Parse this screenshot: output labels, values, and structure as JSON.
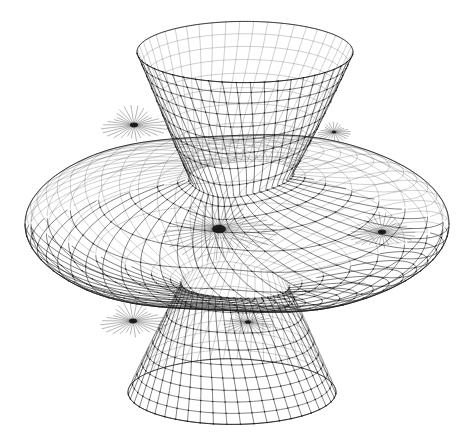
{
  "figure": {
    "title": "Riemann surface wireframe",
    "background_color": "#ffffff",
    "line_color": "#1a1a1a",
    "vertex_color": "#161616",
    "width": 474,
    "height": 446
  },
  "render": {
    "line_width_thin": 0.45,
    "line_width_mid": 0.6,
    "line_width_thick": 0.85,
    "vertex_radius": 0.75,
    "draw_vertices": true
  },
  "camera": {
    "center_x": 237,
    "center_y": 224,
    "scale_x": 210,
    "scale_y": 205,
    "elevation_deg": 22,
    "azimuth_deg": 18,
    "vertical_squash": 0.42
  },
  "chart_data": {
    "type": "surface-wireframe",
    "title": "Riemann surface wireframe",
    "projection": "orthographic",
    "mesh": {
      "u_lines": 48,
      "v_lines": 34,
      "u_range": [
        0,
        6.2831853
      ],
      "v_range": [
        -1.55,
        1.55
      ],
      "quad_count": 1632
    },
    "components": [
      {
        "name": "upper-funnel",
        "description": "trumpet opening flaring upward, rim ellipse at top",
        "rim_center": [
          245,
          52
        ],
        "rim_radius_x": 108,
        "rim_radius_y": 34,
        "throat_center": [
          237,
          170
        ],
        "throat_radius_x": 56,
        "throat_radius_y": 18,
        "top_y": 22
      },
      {
        "name": "outer-brim",
        "description": "wide flared horizontal disk, widest part of the surface",
        "center": [
          237,
          224
        ],
        "radius_x": 212,
        "radius_y": 104,
        "left_x": 25,
        "right_x": 455
      },
      {
        "name": "lower-funnel",
        "description": "trumpet opening flaring downward, rim ellipse at bottom",
        "rim_center": [
          232,
          392
        ],
        "rim_radius_x": 104,
        "rim_radius_y": 36,
        "throat_center": [
          237,
          290
        ],
        "throat_radius_x": 58,
        "throat_radius_y": 18,
        "bottom_y": 428
      }
    ],
    "branch_points": [
      {
        "label": "central-singularity",
        "x": 219,
        "y": 229,
        "size": 7,
        "note": "dominant convergence of mesh curves at center"
      },
      {
        "label": "upper-left-branch",
        "x": 134,
        "y": 125,
        "size": 4,
        "note": "fold where upper funnel meets brim"
      },
      {
        "label": "lower-left-branch",
        "x": 133,
        "y": 321,
        "size": 4,
        "note": "fold where lower funnel meets brim"
      },
      {
        "label": "right-branch",
        "x": 382,
        "y": 232,
        "size": 4,
        "note": "right-hand pinch on the brim"
      },
      {
        "label": "lower-right-branch",
        "x": 248,
        "y": 322,
        "size": 3,
        "note": "secondary pinch below center"
      },
      {
        "label": "upper-right-fold",
        "x": 334,
        "y": 132,
        "size": 2,
        "note": "silhouette fold on upper funnel"
      }
    ],
    "silhouette_bounds": {
      "left": 25,
      "right": 455,
      "top": 22,
      "bottom": 428
    },
    "notes": [
      "Surface is drawn as a curvilinear quadrilateral net, two transverse families of curves.",
      "Mesh density increases strongly toward the central branch point, producing a dark spiral core.",
      "No axes, labels, legend, tick marks, or numeric annotations appear in the image.",
      "Rendering is monochrome line art on a plain white field."
    ]
  },
  "annotations": {
    "axes_visible": false,
    "legend_visible": false,
    "tick_labels": [],
    "text_labels": []
  }
}
